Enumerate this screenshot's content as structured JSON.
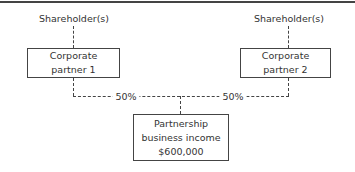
{
  "diagram": {
    "shareholders_left": "Shareholder(s)",
    "shareholders_right": "Shareholder(s)",
    "partner1": {
      "line1": "Corporate",
      "line2": "partner 1"
    },
    "partner2": {
      "line1": "Corporate",
      "line2": "partner 2"
    },
    "share_left": "50%",
    "share_right": "50%",
    "partnership": {
      "line1": "Partnership",
      "line2": "business income",
      "line3": "$600,000"
    }
  },
  "colors": {
    "line": "#444444",
    "text": "#333333",
    "background": "#ffffff"
  }
}
